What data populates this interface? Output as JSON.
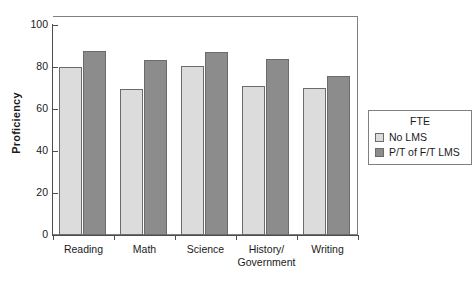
{
  "chart_data": {
    "type": "bar",
    "title": "",
    "xlabel": "",
    "ylabel": "Proficiency",
    "ylim": [
      0,
      100
    ],
    "yticks": [
      0,
      20,
      40,
      60,
      80,
      100
    ],
    "grid": false,
    "legend_position": "right",
    "legend_title": "FTE",
    "categories": [
      "Reading",
      "Math",
      "Science",
      "History/\nGovernment",
      "Writing"
    ],
    "series": [
      {
        "name": "No LMS",
        "color": "#dcdcdc",
        "values": [
          80,
          69.5,
          80.5,
          71,
          70
        ]
      },
      {
        "name": "P/T of F/T LMS",
        "color": "#8c8c8c",
        "values": [
          88,
          83.5,
          87.5,
          84,
          76
        ]
      }
    ]
  },
  "axis": {
    "y_title": "Proficiency",
    "y_tick_labels": [
      "0",
      "20",
      "40",
      "60",
      "80",
      "100"
    ]
  },
  "legend": {
    "title": "FTE",
    "entries": [
      {
        "label": "No LMS",
        "swatch": "light"
      },
      {
        "label": "P/T of F/T LMS",
        "swatch": "dark"
      }
    ]
  }
}
